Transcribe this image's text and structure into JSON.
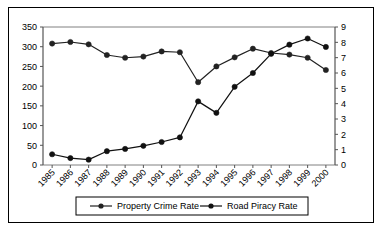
{
  "chart_data": {
    "type": "line",
    "title": "",
    "xlabel": "",
    "categories": [
      "1985",
      "1986",
      "1987",
      "1988",
      "1989",
      "1990",
      "1991",
      "1992",
      "1993",
      "1994",
      "1995",
      "1996",
      "1997",
      "1998",
      "1999",
      "2000"
    ],
    "grid": false,
    "legend_position": "bottom",
    "axes": {
      "left": {
        "label": "",
        "ylim": [
          0,
          350
        ],
        "ticks": [
          0,
          50,
          100,
          150,
          200,
          250,
          300,
          350
        ],
        "tick_labels": [
          "0",
          "50",
          "100",
          "150",
          "200",
          "250",
          "300",
          "350"
        ]
      },
      "right": {
        "label": "",
        "ylim": [
          0,
          9
        ],
        "ticks": [
          0,
          1,
          2,
          3,
          4,
          5,
          6,
          7,
          8,
          9
        ],
        "tick_labels": [
          "0",
          "1",
          "2",
          "3",
          "4",
          "5",
          "6",
          "7",
          "8",
          "9"
        ]
      }
    },
    "series": [
      {
        "name": "Property Crime Rate",
        "axis": "left",
        "marker": "circle",
        "color": "#222222",
        "values": [
          308,
          312,
          306,
          279,
          272,
          275,
          288,
          286,
          210,
          250,
          273,
          295,
          284,
          280,
          272,
          241
        ]
      },
      {
        "name": "Road Piracy Rate",
        "axis": "right",
        "marker": "circle",
        "color": "#111111",
        "values": [
          0.7,
          0.45,
          0.35,
          0.9,
          1.05,
          1.25,
          1.5,
          1.8,
          4.15,
          3.4,
          5.1,
          6.0,
          7.25,
          7.85,
          8.25,
          7.7
        ]
      }
    ],
    "legend": [
      "Property Crime Rate",
      "Road Piracy Rate"
    ]
  }
}
